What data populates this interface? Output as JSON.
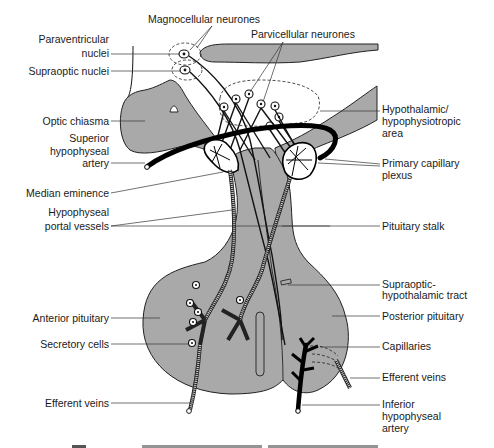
{
  "diagram": {
    "colors": {
      "tissue": "#a9a9a9",
      "outline": "#222222",
      "artery": "#000000",
      "background": "#ffffff",
      "label_text": "#1a1a1a"
    },
    "labels_left": [
      {
        "id": "paraventricular-nuclei",
        "lines": [
          "Paraventricular",
          "nuclei"
        ]
      },
      {
        "id": "supraoptic-nuclei",
        "lines": [
          "Supraoptic nuclei"
        ]
      },
      {
        "id": "optic-chiasma",
        "lines": [
          "Optic chiasma"
        ]
      },
      {
        "id": "superior-hypophyseal-artery",
        "lines": [
          "Superior",
          "hypophyseal",
          "artery"
        ]
      },
      {
        "id": "median-eminence",
        "lines": [
          "Median eminence"
        ]
      },
      {
        "id": "hypophyseal-portal-vessels",
        "lines": [
          "Hypophyseal",
          "portal vessels"
        ]
      },
      {
        "id": "anterior-pituitary",
        "lines": [
          "Anterior pituitary"
        ]
      },
      {
        "id": "secretory-cells",
        "lines": [
          "Secretory cells"
        ]
      },
      {
        "id": "efferent-veins-left",
        "lines": [
          "Efferent veins"
        ]
      }
    ],
    "labels_top": [
      {
        "id": "magnocellular-neurones",
        "lines": [
          "Magnocellular neurones"
        ]
      },
      {
        "id": "parvicellular-neurones",
        "lines": [
          "Parvicellular neurones"
        ]
      }
    ],
    "labels_right": [
      {
        "id": "hypothalamic-area",
        "lines": [
          "Hypothalamic/",
          "hypophysiotropic",
          "area"
        ]
      },
      {
        "id": "primary-capillary-plexus",
        "lines": [
          "Primary capillary",
          "plexus"
        ]
      },
      {
        "id": "pituitary-stalk",
        "lines": [
          "Pituitary stalk"
        ]
      },
      {
        "id": "supraoptic-hypothalamic-tract",
        "lines": [
          "Supraoptic-",
          "hypothalamic tract"
        ]
      },
      {
        "id": "posterior-pituitary",
        "lines": [
          "Posterior pituitary"
        ]
      },
      {
        "id": "capillaries",
        "lines": [
          "Capillaries"
        ]
      },
      {
        "id": "efferent-veins-right",
        "lines": [
          "Efferent veins"
        ]
      },
      {
        "id": "inferior-hypophyseal-artery",
        "lines": [
          "Inferior",
          "hypophyseal",
          "artery"
        ]
      }
    ]
  }
}
